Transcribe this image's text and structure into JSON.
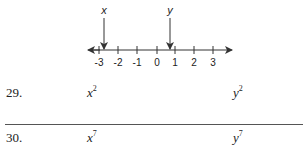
{
  "number_line": {
    "ticks": [
      "-3",
      "-2",
      "-1",
      "0",
      "1",
      "2",
      "3"
    ],
    "markers": [
      {
        "label": "x",
        "position": -3.1
      },
      {
        "label": "y",
        "position": 0.75
      }
    ]
  },
  "problems": [
    {
      "number": "29.",
      "left": {
        "base": "x",
        "exp": "2"
      },
      "right": {
        "base": "y",
        "exp": "2"
      }
    },
    {
      "number": "30.",
      "left": {
        "base": "x",
        "exp": "7"
      },
      "right": {
        "base": "y",
        "exp": "7"
      }
    }
  ]
}
